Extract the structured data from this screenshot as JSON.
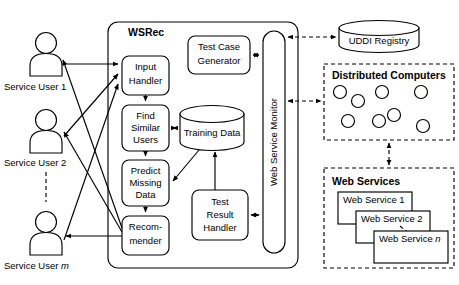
{
  "diagram": {
    "system": {
      "name": "WSRec",
      "components": {
        "input_handler": {
          "line1": "Input",
          "line2": "Handler"
        },
        "find_similar_users": {
          "line1": "Find",
          "line2": "Similar",
          "line3": "Users"
        },
        "predict_missing_data": {
          "line1": "Predict",
          "line2": "Missing",
          "line3": "Data"
        },
        "recommender": {
          "line1": "Recom-",
          "line2": "mender"
        },
        "test_case_generator": {
          "line1": "Test Case",
          "line2": "Generator"
        },
        "test_result_handler": {
          "line1": "Test",
          "line2": "Result",
          "line3": "Handler"
        },
        "training_data": {
          "label": "Training Data"
        },
        "web_service_monitor": {
          "label": "Web Service Monitor"
        }
      }
    },
    "users": [
      {
        "label": "Service User 1",
        "suffix": ""
      },
      {
        "label": "Service User 2",
        "suffix": ""
      },
      {
        "label": "Service User ",
        "suffix": "m"
      }
    ],
    "external": {
      "uddi_registry": {
        "label": "UDDI Registry"
      },
      "distributed_computers": {
        "title": "Distributed Computers",
        "node_count": 8
      },
      "web_services": {
        "title": "Web Services",
        "items": [
          {
            "label": "Web Service 1",
            "suffix": ""
          },
          {
            "label": "Web Service 2",
            "suffix": ""
          },
          {
            "label": "Web Service ",
            "suffix": "n"
          }
        ]
      }
    },
    "colors": {
      "stroke": "#000000",
      "fill": "#ffffff",
      "background": "#ffffff"
    }
  }
}
